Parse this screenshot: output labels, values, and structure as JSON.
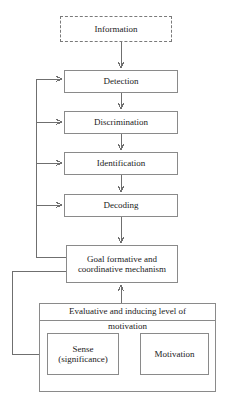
{
  "diagram": {
    "type": "flowchart",
    "orientation": "vertical-top-down-with-feedback",
    "colors": {
      "box_border": "#8a8a8a",
      "connector": "#6f6f6f",
      "background": "#ffffff",
      "text": "#1a1a1a"
    },
    "nodes": {
      "information": {
        "label": "Information",
        "border": "dashed"
      },
      "detection": {
        "label": "Detection",
        "border": "solid"
      },
      "discrimination": {
        "label": "Discrimination",
        "border": "solid"
      },
      "identification": {
        "label": "Identification",
        "border": "solid"
      },
      "decoding": {
        "label": "Decoding",
        "border": "solid"
      },
      "goal": {
        "label_line1": "Goal formative and",
        "label_line2": "coordinative mechanism",
        "border": "solid"
      },
      "evaluative": {
        "label_line1": "Evaluative and inducing level of",
        "label_line2": "motivation",
        "border": "solid"
      },
      "sense": {
        "label_line1": "Sense",
        "label_line2": "(significance)",
        "border": "solid"
      },
      "motivation": {
        "label": "Motivation",
        "border": "solid"
      }
    },
    "edges": [
      {
        "from": "information",
        "to": "detection",
        "style": "arrow-down"
      },
      {
        "from": "detection",
        "to": "discrimination",
        "style": "arrow-down"
      },
      {
        "from": "discrimination",
        "to": "identification",
        "style": "arrow-down"
      },
      {
        "from": "identification",
        "to": "decoding",
        "style": "arrow-down"
      },
      {
        "from": "decoding",
        "to": "goal",
        "style": "arrow-down"
      },
      {
        "from": "evaluative",
        "to": "goal",
        "style": "arrow-up"
      },
      {
        "from": "goal",
        "to": "detection",
        "style": "feedback-left-bus"
      },
      {
        "from": "goal",
        "to": "discrimination",
        "style": "feedback-left-bus"
      },
      {
        "from": "goal",
        "to": "identification",
        "style": "feedback-left-bus"
      },
      {
        "from": "goal",
        "to": "decoding",
        "style": "feedback-left-bus"
      },
      {
        "from": "goal",
        "to": "sense",
        "style": "feedback-outer-left"
      },
      {
        "from": "sense",
        "to": "motivation",
        "style": "arrow-right"
      },
      {
        "from": "motivation",
        "to": "sense",
        "style": "arrow-left"
      }
    ]
  }
}
